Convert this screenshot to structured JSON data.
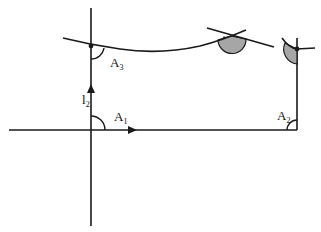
{
  "diagram": {
    "colors": {
      "stroke": "#1a1a1a",
      "shaded_angle": "#a6a6a6",
      "background": "#ffffff"
    },
    "labels": {
      "A1": {
        "main": "A",
        "sub": "1"
      },
      "A2": {
        "main": "A",
        "sub": "2"
      },
      "A3": {
        "main": "A",
        "sub": "3"
      },
      "l2": {
        "main": "l",
        "sub": "2"
      }
    },
    "elements": [
      "horizontal line with rightward arrow",
      "vertical line with upward arrow labelled l2",
      "right vertical segment ending at curve",
      "curved path through A3 point",
      "right angle arc at A1",
      "right angle arc at A2",
      "angle arc at A3",
      "shaded angle at curve-tangent crossing",
      "shaded angle at right-top corner"
    ]
  }
}
